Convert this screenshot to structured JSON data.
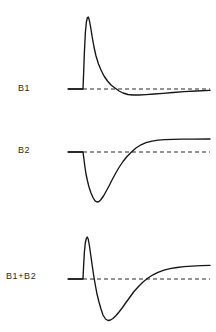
{
  "figure": {
    "background_color": "#ffffff",
    "trace_color": "#151515",
    "baseline_color": "#2a2a2a",
    "label_color": "#2b2b2b"
  },
  "traces": [
    {
      "label": "B1",
      "label_x": 18,
      "label_y": 84,
      "baseline_y": 89,
      "stub_x_start": 68,
      "stub_x_end": 83,
      "dash_x_start": 83,
      "dash_x_end": 210,
      "path": "M 68 89 L 83 89 L 83.6 74 L 84.4 52 L 85.4 32 L 86.4 22 L 87.4 17.5 L 88.3 17 L 89.3 20 L 90.6 27 L 92.2 37 L 94 47 L 96 56 L 98.5 64 L 101 70 L 104 76 L 107.5 81 L 111 85 L 115 88 L 119 91 L 123 93 L 128 94.5 L 133 95 L 139 95 L 146 94.6 L 154 94 L 163 93.3 L 173 92.5 L 184 91.7 L 196 91 L 210 90.3"
    },
    {
      "label": "B2",
      "label_x": 18,
      "label_y": 146,
      "baseline_y": 152,
      "stub_x_start": 68,
      "stub_x_end": 83,
      "dash_x_start": 83,
      "dash_x_end": 210,
      "path": "M 68 152 L 83 152 L 83.8 158 L 84.8 166 L 86 174 L 87.5 181 L 89 187 L 91 193 L 93 197.5 L 95 200.8 L 97 202 L 99 201.5 L 101 199.5 L 103.5 196 L 106 191.5 L 109 186 L 112 180 L 115.5 173.5 L 119 167.5 L 123 161.5 L 127 156.5 L 131.5 152 L 136 148 L 141 144.8 L 146 142.6 L 152 141.1 L 158 140.2 L 165 139.7 L 173 139.4 L 182 139.2 L 192 139.1 L 210 139"
    },
    {
      "label": "B1+B2",
      "label_x": 6,
      "label_y": 272,
      "baseline_y": 279,
      "stub_x_start": 68,
      "stub_x_end": 83,
      "dash_x_start": 83,
      "dash_x_end": 210,
      "path": "M 68 279 L 83 279 L 83.6 266 L 84.4 252 L 85.3 243 L 86.3 238.5 L 87.2 237 L 88.2 239 L 89.3 245 L 90.6 254 L 92 264 L 93.6 275 L 95.3 285 L 97 294 L 99 302 L 101 309 L 103 315 L 105.5 319 L 108 320.5 L 110.5 320 L 113 318.5 L 116 315.5 L 119 312 L 122.5 307.5 L 126 302.5 L 130 297 L 134 291.5 L 138.5 286.5 L 143 282 L 148 278 L 153 274.8 L 158 272.3 L 164 270.2 L 170 268.7 L 177 267.5 L 184 266.7 L 192 266.1 L 201 265.7 L 210 265.4"
    }
  ]
}
